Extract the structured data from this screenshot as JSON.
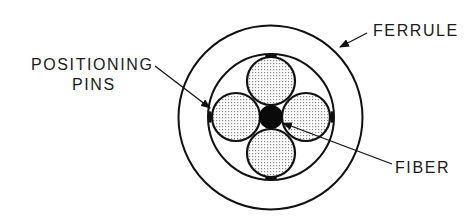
{
  "diagram": {
    "type": "cross-section",
    "labels": {
      "ferrule": "FERRULE",
      "positioning_line1": "POSITIONING",
      "positioning_line2": "PINS",
      "fiber": "FIBER"
    },
    "components": [
      {
        "name": "ferrule",
        "shape": "circle",
        "cx": 270.5,
        "cy": 117.5,
        "r": 92
      },
      {
        "name": "sleeve",
        "shape": "circle",
        "cx": 271,
        "cy": 117,
        "r": 63
      },
      {
        "name": "positioning-pin-top",
        "shape": "circle",
        "cx": 271,
        "cy": 81,
        "r": 24,
        "fill": "stipple"
      },
      {
        "name": "positioning-pin-left",
        "shape": "circle",
        "cx": 236,
        "cy": 117,
        "r": 24,
        "fill": "stipple"
      },
      {
        "name": "positioning-pin-right",
        "shape": "circle",
        "cx": 306,
        "cy": 117,
        "r": 24,
        "fill": "stipple"
      },
      {
        "name": "positioning-pin-bottom",
        "shape": "circle",
        "cx": 271,
        "cy": 153,
        "r": 24,
        "fill": "stipple"
      },
      {
        "name": "fiber",
        "shape": "circle",
        "cx": 271,
        "cy": 117,
        "r": 12,
        "fill": "solid"
      }
    ],
    "leaders": [
      {
        "label": "ferrule",
        "from": [
          367,
          33
        ],
        "to": [
          340,
          47
        ]
      },
      {
        "label": "positioning-pins",
        "from": [
          155,
          66
        ],
        "to": [
          210,
          108
        ]
      },
      {
        "label": "fiber",
        "from": [
          392,
          164
        ],
        "to": [
          283,
          123
        ]
      }
    ],
    "colors": {
      "line": "#111111",
      "stipple_dot": "#8a8a8a",
      "fiber_fill": "#0a0a0a",
      "background": "#ffffff"
    }
  }
}
